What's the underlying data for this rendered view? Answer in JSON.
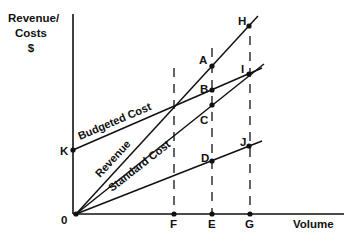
{
  "diagram": {
    "y_axis_label": [
      "Revenue/",
      "Costs",
      "$"
    ],
    "x_axis_label": "Volume",
    "origin_label": "0",
    "lines": [
      {
        "name": "Revenue",
        "label": "Revenue",
        "from": "0",
        "to": "H"
      },
      {
        "name": "Budgeted Cost",
        "label": "Budgeted Cost",
        "from": "K",
        "to": "I"
      },
      {
        "name": "Standard Cost",
        "label": "Standard Cost",
        "from": "0",
        "to": "I"
      },
      {
        "name": "Variable cost line",
        "label": "",
        "from": "0",
        "to": "J"
      }
    ],
    "points": {
      "K": "K",
      "A": "A",
      "B": "B",
      "C": "C",
      "D": "D",
      "H": "H",
      "I": "I",
      "J": "J",
      "F": "F",
      "E": "E",
      "G": "G"
    },
    "x_ticks": [
      "F",
      "E",
      "G"
    ],
    "dashed_verticals": [
      "F",
      "E",
      "G"
    ]
  }
}
